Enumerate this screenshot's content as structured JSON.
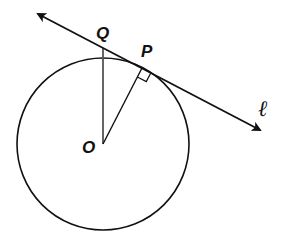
{
  "figure": {
    "type": "geometry",
    "colors": {
      "stroke": "#111111",
      "radius_oq": "#555555",
      "background": "#ffffff"
    }
  },
  "labels": {
    "center": "O",
    "tangent_point": "P",
    "line_point": "Q",
    "line": "ℓ"
  },
  "elements": {
    "circle": {
      "center": [
        103,
        144
      ],
      "radius": 86
    },
    "tangent_line": {
      "from": [
        34,
        12
      ],
      "to": [
        264,
        132
      ],
      "arrows": "both"
    },
    "segment_op": {
      "from": [
        103,
        144
      ],
      "to": [
        142,
        68
      ]
    },
    "segment_oq": {
      "from": [
        103,
        144
      ],
      "to": [
        103,
        48
      ]
    },
    "right_angle_marker": {
      "at": "P"
    }
  }
}
